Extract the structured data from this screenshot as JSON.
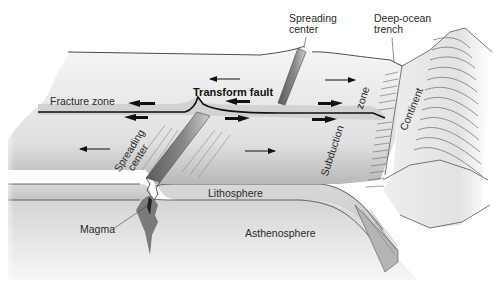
{
  "diagram": {
    "labels": {
      "spreading_center_top": [
        "Spreading",
        "center"
      ],
      "deep_ocean_trench": [
        "Deep-ocean",
        "trench"
      ],
      "fracture_zone": "Fracture zone",
      "transform_fault": "Transform fault",
      "spreading_center_left": [
        "Spreading",
        "center"
      ],
      "subduction_zone": [
        "Subduction",
        "zone"
      ],
      "continent": "Continent",
      "lithosphere": "Lithosphere",
      "magma": "Magma",
      "asthenosphere": "Asthenosphere"
    },
    "arrows": [
      {
        "id": "plate-motion-top-left",
        "direction": "left"
      },
      {
        "id": "plate-motion-top-right",
        "direction": "right"
      },
      {
        "id": "plate-motion-bottom-left",
        "direction": "left"
      },
      {
        "id": "plate-motion-bottom-right",
        "direction": "right"
      },
      {
        "id": "transform-shear-arrows",
        "direction": "opposing"
      }
    ],
    "colors": {
      "background": "#ffffff",
      "surface_light": "#f2f2f2",
      "surface_mid": "#d6d6d6",
      "surface_dark": "#9a9a9a",
      "lithosphere": "#cfcfcf",
      "asthenosphere": "#e3e3e3",
      "magma": "#6e6e6e",
      "outline": "#333333"
    }
  }
}
